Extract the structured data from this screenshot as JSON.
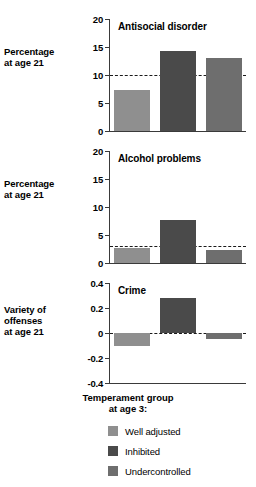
{
  "chart_data": [
    {
      "type": "bar",
      "title": "Antisocial disorder",
      "categories": [
        "Well adjusted",
        "Inhibited",
        "Undercontrolled"
      ],
      "values": [
        7.3,
        14.3,
        13.0
      ],
      "xlabel": "",
      "ylabel": "Percentage at age 21",
      "ylim": [
        0,
        20
      ],
      "yticks": [
        0,
        5,
        10,
        15,
        20
      ],
      "ytick_labels": [
        "0",
        "5",
        "10",
        "15",
        "20"
      ],
      "reference_line": 10,
      "grid": false
    },
    {
      "type": "bar",
      "title": "Alcohol problems",
      "categories": [
        "Well adjusted",
        "Inhibited",
        "Undercontrolled"
      ],
      "values": [
        2.7,
        7.7,
        2.4
      ],
      "xlabel": "",
      "ylabel": "Percentage at age 21",
      "ylim": [
        0,
        20
      ],
      "yticks": [
        0,
        5,
        10,
        15,
        20
      ],
      "ytick_labels": [
        "0",
        "5",
        "10",
        "15",
        "20"
      ],
      "reference_line": 3,
      "grid": false
    },
    {
      "type": "bar",
      "title": "Crime",
      "categories": [
        "Well adjusted",
        "Inhibited",
        "Undercontrolled"
      ],
      "values": [
        -0.1,
        0.28,
        -0.05
      ],
      "xlabel": "",
      "ylabel": "Variety of offenses at age 21",
      "ylim": [
        -0.4,
        0.4
      ],
      "yticks": [
        -0.4,
        -0.2,
        0,
        0.2,
        0.4
      ],
      "ytick_labels": [
        "-0.4",
        "-0.2",
        "0",
        "0.2",
        "0.4"
      ],
      "reference_line": 0,
      "grid": false
    }
  ],
  "panels": [
    {
      "title": "Antisocial disorder",
      "axis_label_line1": "Percentage",
      "axis_label_line2": "at age 21",
      "ticks": [
        "20",
        "15",
        "10",
        "5",
        "0"
      ]
    },
    {
      "title": "Alcohol problems",
      "axis_label_line1": "Percentage",
      "axis_label_line2": "at age 21",
      "ticks": [
        "20",
        "15",
        "10",
        "5",
        "0"
      ]
    },
    {
      "title": "Crime",
      "axis_label_line1": "Variety of",
      "axis_label_line2": "offenses",
      "axis_label_line3": "at age 21",
      "ticks": [
        "0.4",
        "0.2",
        "0",
        "-0.2",
        "-0.4"
      ]
    }
  ],
  "caption": {
    "line1": "Temperament group",
    "line2": "at age 3:"
  },
  "legend": {
    "items": [
      {
        "label": "Well adjusted",
        "color": "#8f8f8f"
      },
      {
        "label": "Inhibited",
        "color": "#4a4a4a"
      },
      {
        "label": "Undercontrolled",
        "color": "#6e6e6e"
      }
    ]
  },
  "colors": {
    "well_adjusted": "#8f8f8f",
    "inhibited": "#4a4a4a",
    "undercontrolled": "#6e6e6e",
    "axis": "#3a3a3a",
    "background": "#ffffff"
  }
}
